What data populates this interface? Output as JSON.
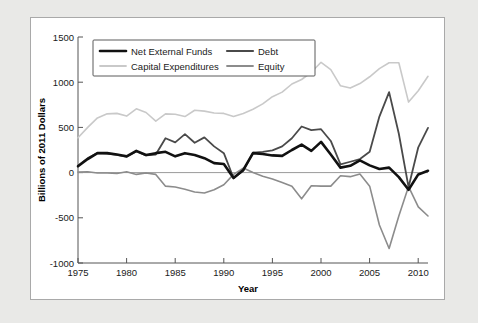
{
  "chart_data": {
    "type": "line",
    "title": "",
    "xlabel": "Year",
    "ylabel": "Billions of 2011 Dollars",
    "xlim": [
      1975,
      2011
    ],
    "ylim": [
      -1000,
      1500
    ],
    "xticks": [
      1975,
      1980,
      1985,
      1990,
      1995,
      2000,
      2005,
      2010
    ],
    "yticks": [
      1500,
      1000,
      500,
      0,
      -500,
      -1000
    ],
    "grid": false,
    "legend_position": "top-left",
    "zero_line": true,
    "x": [
      1975,
      1976,
      1977,
      1978,
      1979,
      1980,
      1981,
      1982,
      1983,
      1984,
      1985,
      1986,
      1987,
      1988,
      1989,
      1990,
      1991,
      1992,
      1993,
      1994,
      1995,
      1996,
      1997,
      1998,
      1999,
      2000,
      2001,
      2002,
      2003,
      2004,
      2005,
      2006,
      2007,
      2008,
      2009,
      2010,
      2011
    ],
    "series": [
      {
        "name": "Net External Funds",
        "color": "#111111",
        "width": 2.6,
        "values": [
          70,
          150,
          215,
          215,
          200,
          180,
          240,
          195,
          215,
          230,
          180,
          215,
          195,
          160,
          105,
          95,
          -60,
          30,
          215,
          205,
          190,
          185,
          250,
          310,
          240,
          340,
          200,
          55,
          75,
          135,
          80,
          40,
          55,
          -50,
          -190,
          -20,
          20
        ]
      },
      {
        "name": "Debt",
        "color": "#4a4a4a",
        "width": 1.8,
        "values": [
          75,
          160,
          215,
          210,
          195,
          175,
          235,
          190,
          200,
          380,
          335,
          425,
          330,
          390,
          290,
          215,
          -60,
          20,
          220,
          230,
          245,
          290,
          380,
          510,
          470,
          480,
          350,
          90,
          120,
          150,
          230,
          620,
          890,
          430,
          -160,
          280,
          495
        ]
      },
      {
        "name": "Capital Expenditures",
        "color": "#c9c9c9",
        "width": 1.6,
        "values": [
          385,
          500,
          605,
          650,
          655,
          625,
          705,
          665,
          570,
          650,
          645,
          620,
          690,
          680,
          660,
          655,
          620,
          655,
          700,
          760,
          840,
          890,
          980,
          1030,
          1110,
          1220,
          1140,
          960,
          935,
          985,
          1060,
          1150,
          1215,
          1215,
          780,
          905,
          1065
        ]
      },
      {
        "name": "Equity",
        "color": "#8c8c8c",
        "width": 1.6,
        "values": [
          5,
          10,
          -5,
          -5,
          -10,
          10,
          -20,
          -5,
          -20,
          -150,
          -160,
          -185,
          -215,
          -225,
          -190,
          -135,
          -20,
          50,
          0,
          -40,
          -70,
          -110,
          -150,
          -290,
          -145,
          -150,
          -150,
          -35,
          -45,
          -15,
          -150,
          -580,
          -840,
          -480,
          -155,
          -380,
          -480
        ]
      }
    ],
    "annotations": []
  },
  "legend": {
    "entries": [
      {
        "label": "Net External Funds"
      },
      {
        "label": "Debt"
      },
      {
        "label": "Capital Expenditures"
      },
      {
        "label": "Equity"
      }
    ]
  }
}
